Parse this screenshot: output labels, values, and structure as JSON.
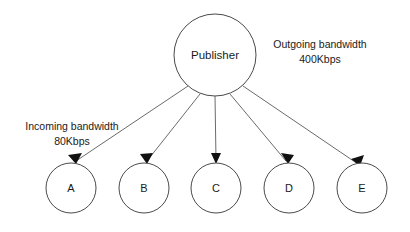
{
  "diagram": {
    "type": "star-topology-bandwidth-diagram",
    "background_color": "#ffffff",
    "node_stroke_color": "#4a4a4a",
    "edge_color": "#6b6b6b",
    "arrow_color": "#111111",
    "text_color": "#1a1a1a",
    "hub": {
      "label": "Publisher",
      "cx": 215,
      "cy": 55,
      "r": 41
    },
    "subscribers": [
      {
        "label": "A",
        "cx": 71,
        "cy": 188,
        "r": 25
      },
      {
        "label": "B",
        "cx": 144,
        "cy": 188,
        "r": 25
      },
      {
        "label": "C",
        "cx": 216,
        "cy": 188,
        "r": 25
      },
      {
        "label": "D",
        "cx": 289,
        "cy": 188,
        "r": 25
      },
      {
        "label": "E",
        "cx": 362,
        "cy": 188,
        "r": 25
      }
    ],
    "annotations": {
      "outgoing": {
        "line1": "Outgoing bandwidth",
        "line2": "400Kbps",
        "x": 320,
        "y1": 48,
        "y2": 63
      },
      "incoming": {
        "line1": "Incoming bandwidth",
        "line2": "80Kbps",
        "x": 72,
        "y1": 130,
        "y2": 145
      }
    }
  }
}
